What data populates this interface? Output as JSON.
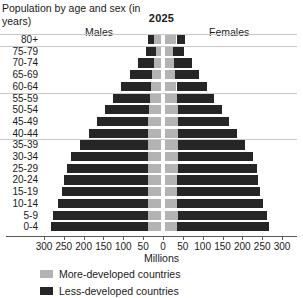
{
  "chart_data": {
    "type": "bar",
    "subtype": "population-pyramid-stacked",
    "title": "Population by age and sex (in years)",
    "year_label": "2025",
    "xlabel": "Millions",
    "ylabel": "Population by age and sex (in years)",
    "left_group": "Males",
    "right_group": "Females",
    "grid": true,
    "legend_position": "bottom-left",
    "xlim": [
      -300,
      300
    ],
    "xticks": [
      300,
      250,
      200,
      150,
      100,
      50,
      0,
      50,
      100,
      150,
      200,
      250,
      300
    ],
    "xtick_labels": [
      "300",
      "250",
      "200",
      "150",
      "100",
      "50",
      "0",
      "50",
      "100",
      "150",
      "200",
      "250",
      "300"
    ],
    "categories": [
      "80+",
      "75-79",
      "70-74",
      "65-69",
      "60-64",
      "55-59",
      "50-54",
      "45-49",
      "40-44",
      "35-39",
      "30-34",
      "25-29",
      "20-24",
      "15-19",
      "10-14",
      "5-9",
      "0-4"
    ],
    "series": [
      {
        "name": "More-developed countries",
        "color": "#b3b3b3",
        "males": [
          18,
          14,
          19,
          23,
          27,
          29,
          31,
          33,
          33,
          34,
          35,
          34,
          33,
          33,
          34,
          35,
          34
        ],
        "females": [
          30,
          20,
          24,
          27,
          30,
          31,
          33,
          34,
          34,
          34,
          34,
          33,
          32,
          31,
          32,
          33,
          32
        ]
      },
      {
        "name": "Less-developed countries",
        "color": "#262626",
        "males": [
          16,
          26,
          40,
          56,
          74,
          92,
          110,
          129,
          150,
          172,
          192,
          205,
          212,
          218,
          227,
          237,
          244
        ],
        "females": [
          22,
          30,
          45,
          60,
          77,
          94,
          111,
          129,
          149,
          169,
          188,
          199,
          204,
          209,
          216,
          224,
          231
        ]
      }
    ],
    "male_totals": [
      34,
      40,
      59,
      79,
      101,
      121,
      141,
      162,
      183,
      206,
      227,
      239,
      245,
      251,
      261,
      272,
      278
    ],
    "female_totals": [
      52,
      50,
      69,
      87,
      107,
      125,
      144,
      163,
      183,
      203,
      222,
      232,
      236,
      240,
      248,
      257,
      263
    ]
  },
  "legend": {
    "items": [
      {
        "label": "More-developed countries",
        "color": "#b3b3b3",
        "swatch_name": "legend-swatch-more-developed"
      },
      {
        "label": "Less-developed countries",
        "color": "#262626",
        "swatch_name": "legend-swatch-less-developed"
      }
    ]
  }
}
